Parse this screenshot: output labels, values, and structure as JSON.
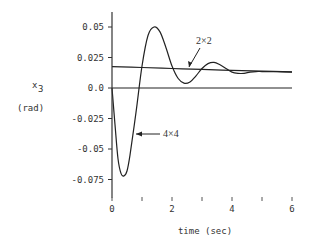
{
  "chart_data": {
    "type": "line",
    "title": "",
    "xlabel": "time (sec)",
    "ylabel": "x3",
    "ylabel_sub": "3",
    "ylabel_main": "x",
    "ylabel_unit": "(rad)",
    "xlim": [
      0,
      6
    ],
    "ylim": [
      -0.085,
      0.06
    ],
    "x_ticks": [
      0,
      1,
      2,
      3,
      4,
      5,
      6
    ],
    "x_tick_labels": [
      "0",
      "",
      "2",
      "",
      "4",
      "",
      "6"
    ],
    "y_ticks": [
      0.05,
      0.025,
      0.0,
      -0.025,
      -0.05,
      -0.075
    ],
    "y_tick_labels": [
      "0.05",
      "0.025",
      "0.0",
      "-0.025",
      "-0.05",
      "-0.075"
    ],
    "grid": false,
    "legend": "none (inline annotations)",
    "annotations": [
      {
        "text": "2×2",
        "points_to": "2x2 model response"
      },
      {
        "text": "4×4",
        "points_to": "4x4 model response"
      }
    ],
    "series": [
      {
        "name": "2×2",
        "x": [
          0,
          1,
          2,
          3,
          4,
          5,
          6
        ],
        "y": [
          0.0175,
          0.0168,
          0.016,
          0.0152,
          0.0145,
          0.0138,
          0.0132
        ]
      },
      {
        "name": "4×4",
        "x": [
          0,
          0.1,
          0.2,
          0.3,
          0.4,
          0.5,
          0.6,
          0.8,
          1.0,
          1.2,
          1.4,
          1.6,
          1.8,
          2.0,
          2.2,
          2.4,
          2.6,
          2.8,
          3.0,
          3.2,
          3.4,
          3.6,
          3.8,
          4.0,
          4.2,
          4.4,
          4.6,
          4.8,
          5.0,
          5.5,
          6.0
        ],
        "y": [
          0.0,
          -0.03,
          -0.058,
          -0.07,
          -0.072,
          -0.068,
          -0.055,
          -0.02,
          0.018,
          0.043,
          0.05,
          0.046,
          0.033,
          0.018,
          0.008,
          0.004,
          0.005,
          0.01,
          0.016,
          0.02,
          0.021,
          0.019,
          0.016,
          0.013,
          0.012,
          0.012,
          0.013,
          0.0135,
          0.0135,
          0.0133,
          0.013
        ]
      },
      {
        "name": "zero reference",
        "x": [
          0,
          6
        ],
        "y": [
          0.0,
          0.0
        ]
      }
    ]
  }
}
